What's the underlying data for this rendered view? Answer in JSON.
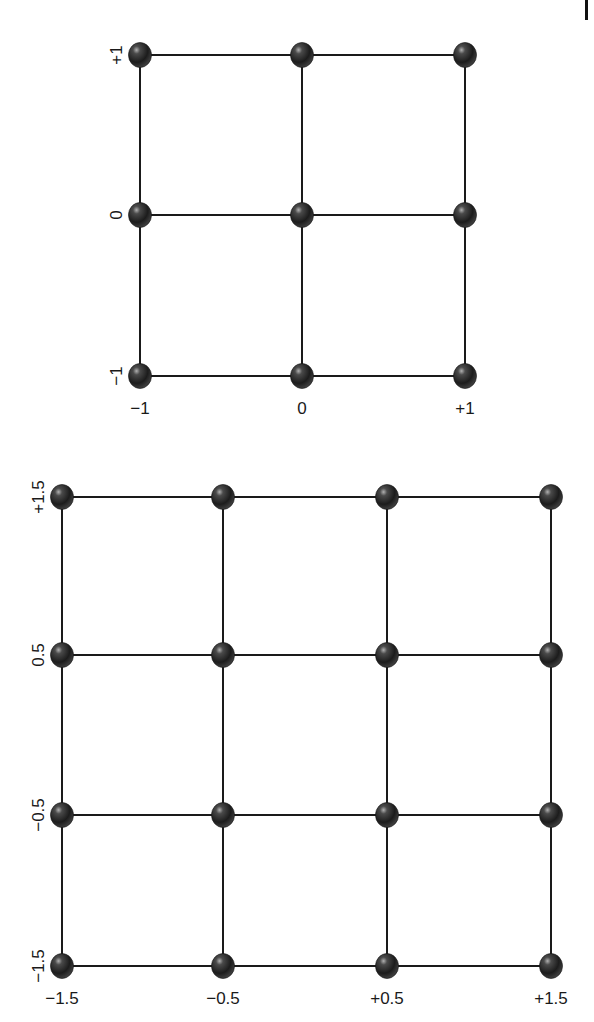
{
  "chart_data": [
    {
      "type": "lattice-grid",
      "title": "",
      "description": "3x3 lattice of spheres connected by lines",
      "x_ticks": [
        "−1",
        "0",
        "+1"
      ],
      "y_ticks": [
        "−1",
        "0",
        "+1"
      ],
      "x_values": [
        -1,
        0,
        1
      ],
      "y_values": [
        -1,
        0,
        1
      ],
      "node_count": 9,
      "grid": true,
      "legend": "none"
    },
    {
      "type": "lattice-grid",
      "title": "",
      "description": "4x4 lattice of spheres connected by lines",
      "x_ticks": [
        "−1.5",
        "−0.5",
        "+0.5",
        "+1.5"
      ],
      "y_ticks": [
        "−1.5",
        "−0.5",
        "0.5",
        "+1.5"
      ],
      "x_values": [
        -1.5,
        -0.5,
        0.5,
        1.5
      ],
      "y_values": [
        -1.5,
        -0.5,
        0.5,
        1.5
      ],
      "node_count": 16,
      "grid": true,
      "legend": "none"
    }
  ],
  "diagrams": {
    "top": {
      "x_px": [
        140,
        302,
        465
      ],
      "y_px": [
        376,
        215,
        55
      ],
      "x_ticks": [
        "−1",
        "0",
        "+1"
      ],
      "y_ticks": [
        "−1",
        "0",
        "+1"
      ],
      "x_label_y": 414,
      "y_label_x": 116
    },
    "bottom": {
      "x_px": [
        62,
        223,
        387,
        551
      ],
      "y_px": [
        966,
        815,
        655,
        497
      ],
      "x_ticks": [
        "−1.5",
        "−0.5",
        "+0.5",
        "+1.5"
      ],
      "y_ticks": [
        "−1.5",
        "−0.5",
        "0.5",
        "+1.5"
      ],
      "x_label_y": 1004,
      "y_label_x": 38
    }
  },
  "style": {
    "line_color": "#1a1a1a",
    "node_color": "#2a2a2a",
    "node_highlight": "#9a9a9a",
    "background": "#ffffff"
  }
}
